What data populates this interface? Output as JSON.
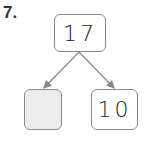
{
  "question": {
    "number": "7."
  },
  "number_bond": {
    "whole": "17",
    "parts": [
      {
        "value": "",
        "blank": true
      },
      {
        "value": "10",
        "blank": false
      }
    ]
  },
  "colors": {
    "border": "#8a8a8a",
    "blank_fill": "#ececec",
    "arrow": "#888888"
  }
}
